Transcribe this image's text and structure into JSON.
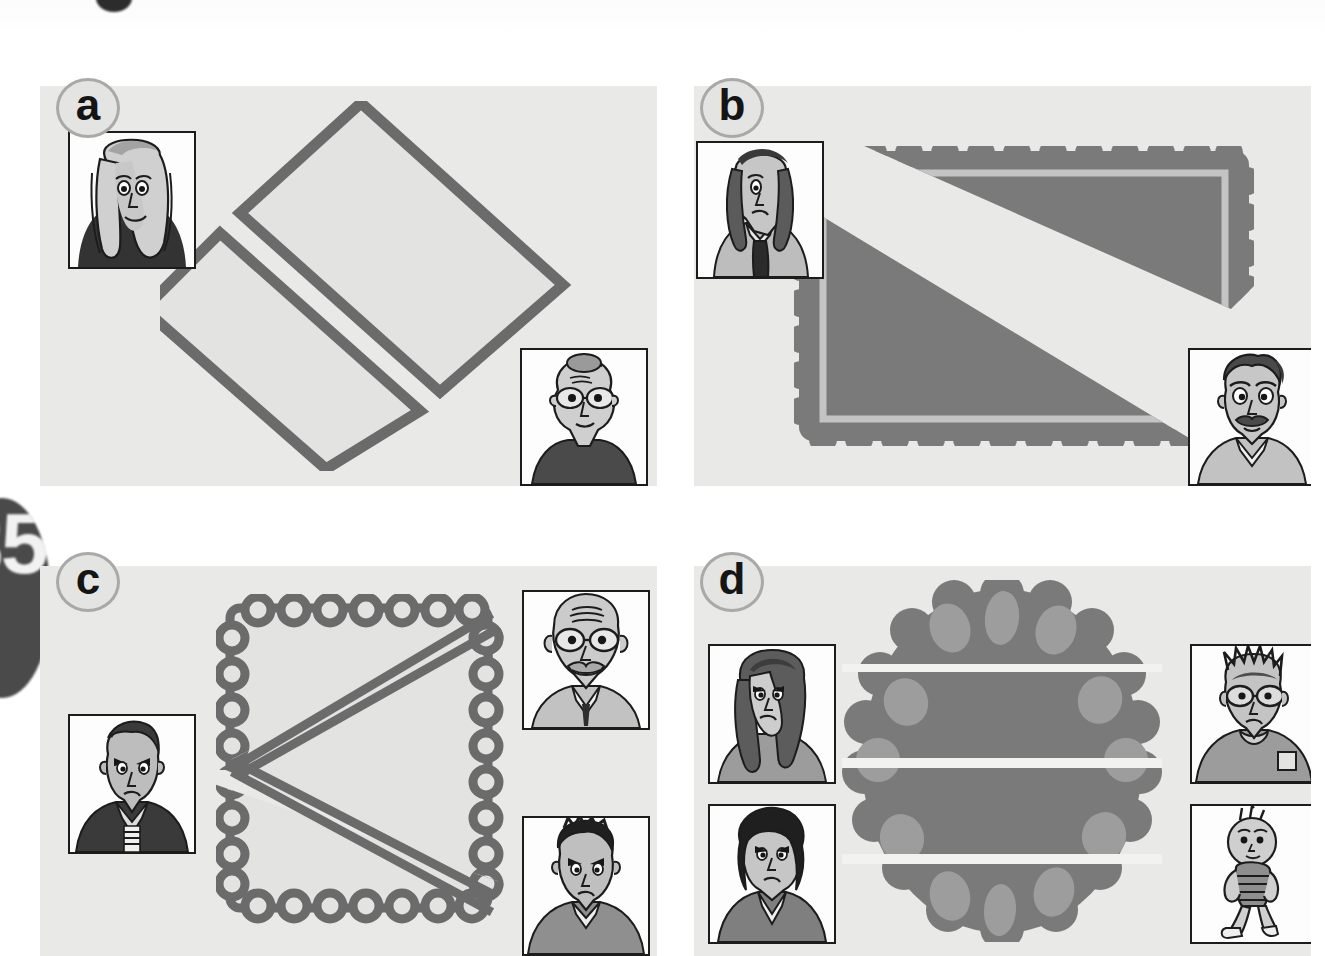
{
  "page": {
    "tab_number": "35",
    "background_color": "#ffffff",
    "panel_background_color": "#e9e9e7",
    "ink_color": "#6b6b6b",
    "dark_fill_color": "#7a7a7a",
    "light_fill_color": "#e3e3e1",
    "chip_color": "#9a9a9a",
    "cut_line_color": "#f2f2f0"
  },
  "panels": [
    {
      "id": "a",
      "label": "a",
      "shape_name": "square-rotated-45",
      "shape_description": "Square tilted 45 degrees, cut into two equal rectangles by a straight line; the two halves are slightly pulled apart.",
      "fill": "light",
      "edge": "straight",
      "pieces": 2,
      "cut_type": "straight-line-through-middle",
      "characters": [
        {
          "name": "curly-haired-woman",
          "position": "top-left",
          "hair": "long curly light hair",
          "clothing": "dark turtleneck"
        },
        {
          "name": "elderly-woman-glasses",
          "position": "bottom-right",
          "hair": "hair in a bun",
          "clothing": "dark jacket"
        }
      ]
    },
    {
      "id": "b",
      "label": "b",
      "shape_name": "scalloped-rectangle",
      "shape_description": "Dark scalloped-edge rectangle (biscuit) cut along the diagonal into two right-angled triangles, slightly pulled apart.",
      "fill": "dark",
      "edge": "scalloped",
      "pieces": 2,
      "cut_type": "diagonal",
      "characters": [
        {
          "name": "curly-haired-woman-tie",
          "position": "top-left",
          "hair": "long curly hair",
          "clothing": "shirt with long dark tie"
        },
        {
          "name": "moustached-man",
          "position": "bottom-right",
          "hair": "dark wavy hair",
          "clothing": "collared shirt"
        }
      ]
    },
    {
      "id": "c",
      "label": "c",
      "shape_name": "scalloped-square",
      "shape_description": "Light scalloped-edge square cut by two diagonals that meet at the middle of the left edge, making three triangles.",
      "fill": "light",
      "edge": "scalloped",
      "pieces": 3,
      "cut_type": "two-diagonals-meeting-left",
      "characters": [
        {
          "name": "angry-boy-jacket",
          "position": "left",
          "hair": "short spiky hair",
          "clothing": "dark jacket with striped shirt"
        },
        {
          "name": "bald-man-glasses",
          "position": "top-right",
          "hair": "bald with beard",
          "clothing": "collared shirt"
        },
        {
          "name": "dark-haired-boy",
          "position": "bottom-right",
          "hair": "dark spiky hair",
          "clothing": "grey jumper"
        }
      ]
    },
    {
      "id": "d",
      "label": "d",
      "shape_name": "chocolate-chip-cookie",
      "shape_description": "Round scalloped chocolate-chip cookie cut by three parallel horizontal lines into four strips.",
      "fill": "dark",
      "edge": "scalloped-circle",
      "pieces": 4,
      "cut_type": "three-parallel-horizontal",
      "chip_count": 14,
      "characters": [
        {
          "name": "long-haired-girl",
          "position": "top-left",
          "hair": "long straight hair",
          "clothing": "grey jumper"
        },
        {
          "name": "short-haired-girl",
          "position": "bottom-left",
          "hair": "dark bobbed hair",
          "clothing": "v-neck jumper"
        },
        {
          "name": "spiky-boy-glasses",
          "position": "top-right",
          "hair": "spiky hair",
          "clothing": "jumper"
        },
        {
          "name": "toddler",
          "position": "bottom-right",
          "hair": "tufty hair",
          "clothing": "striped shirt"
        }
      ]
    }
  ]
}
